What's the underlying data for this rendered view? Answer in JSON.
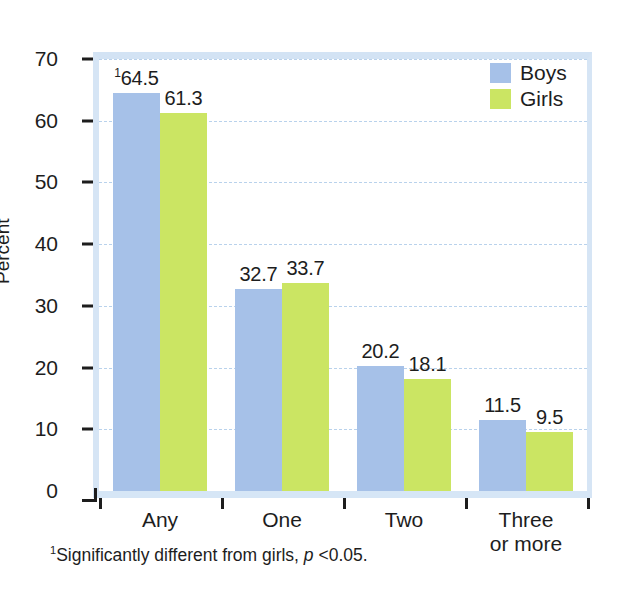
{
  "chart_data": {
    "type": "bar",
    "title": "",
    "subtitle": "",
    "xlabel": "",
    "ylabel": "Percent",
    "ylim": [
      0,
      70
    ],
    "ytick_step": 10,
    "yticks": [
      "0",
      "10",
      "20",
      "30",
      "40",
      "50",
      "60",
      "70"
    ],
    "grid": true,
    "grid_style": "dashed-horizontal",
    "legend_position": "top-right",
    "categories": [
      "Any",
      "One",
      "Two",
      "Three or more"
    ],
    "category_lines": [
      [
        "Any"
      ],
      [
        "One"
      ],
      [
        "Two"
      ],
      [
        "Three",
        "or more"
      ]
    ],
    "series": [
      {
        "name": "Boys",
        "color": "#a6c1e8",
        "values": [
          64.5,
          32.7,
          20.2,
          11.5
        ],
        "labels": [
          "64.5",
          "32.7",
          "20.2",
          "11.5"
        ]
      },
      {
        "name": "Girls",
        "color": "#cbe563",
        "values": [
          61.3,
          33.7,
          18.1,
          9.5
        ],
        "labels": [
          "61.3",
          "33.7",
          "18.1",
          "9.5"
        ]
      }
    ],
    "annotations": [
      {
        "marker": "1",
        "attached_to": "Boys / Any",
        "text": "Significantly different from girls, p <0.05."
      }
    ]
  },
  "legend": {
    "items": [
      {
        "label": "Boys",
        "color": "#a6c1e8"
      },
      {
        "label": "Girls",
        "color": "#cbe563"
      }
    ]
  },
  "axis": {
    "y_title": "Percent",
    "y_ticks": [
      "70",
      "60",
      "50",
      "40",
      "30",
      "20",
      "10",
      "0"
    ],
    "x_ticks": [
      "Any",
      "One",
      "Two",
      "Three",
      "or more"
    ]
  },
  "footnote": {
    "marker": "1",
    "prefix": "Significantly different from girls, ",
    "italic": "p",
    "suffix": " <0.05."
  },
  "colors": {
    "boys": "#a6c1e8",
    "girls": "#cbe563",
    "grid": "#b9d2ec",
    "frame": "#d6e5f5",
    "text": "#1d1d1d",
    "background": "#ffffff"
  }
}
